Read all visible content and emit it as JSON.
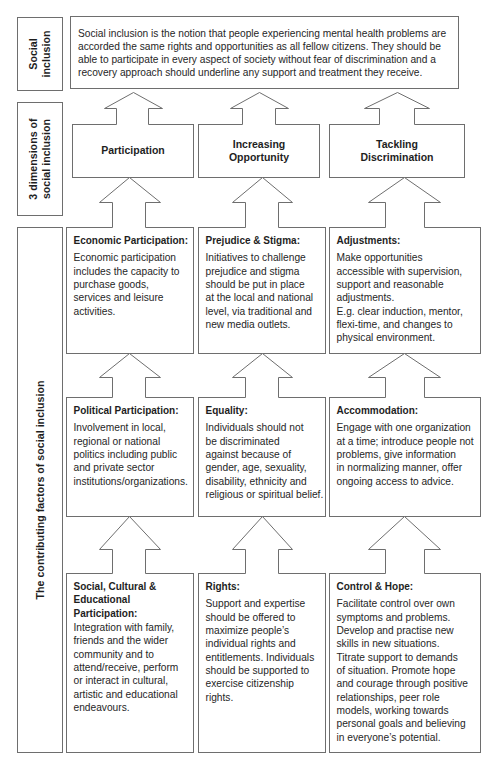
{
  "labels": {
    "social_inclusion": "Social\ninclusion",
    "dimensions": "3 dimensions of\nsocial inclusion",
    "factors": "The contributing factors of social inclusion"
  },
  "definition": "Social inclusion is the notion that people experiencing mental health problems are\naccorded the same rights and opportunities as all fellow citizens. They should be\nable to participate in every aspect of society without fear of discrimination and a\nrecovery approach should underline any support and treatment they receive.",
  "dimensions": [
    {
      "label": "Participation"
    },
    {
      "label": "Increasing\nOpportunity"
    },
    {
      "label": "Tackling\nDiscrimination"
    }
  ],
  "factors": {
    "rows": [
      {
        "cards": [
          {
            "heading": "Economic Participation:",
            "body": "Economic participation\nincludes the capacity to\npurchase goods,\nservices and leisure\nactivities."
          },
          {
            "heading": "Prejudice & Stigma:",
            "body": "Initiatives to challenge\nprejudice and stigma\nshould be put in place\nat the local and national\nlevel, via traditional and\nnew media outlets."
          },
          {
            "heading": "Adjustments:",
            "body": "Make opportunities\naccessible with supervision,\nsupport and reasonable\nadjustments.\nE.g. clear induction, mentor,\nflexi-time, and changes to\nphysical environment."
          }
        ]
      },
      {
        "cards": [
          {
            "heading": "Political Participation:",
            "body": "Involvement in local,\nregional or national\npolitics including public\nand private sector\ninstitutions/organizations."
          },
          {
            "heading": "Equality:",
            "body": "Individuals should not\nbe discriminated\nagainst because of\ngender, age, sexuality,\ndisability, ethnicity and\nreligious or spiritual belief."
          },
          {
            "heading": "Accommodation:",
            "body": "Engage with one organization\nat a time; introduce people not\nproblems, give information\nin normalizing manner, offer\nongoing access to advice."
          }
        ]
      },
      {
        "cards": [
          {
            "heading": "Social, Cultural &\nEducational\nParticipation:",
            "body": "Integration with family,\nfriends and the wider\ncommunity and to\nattend/receive, perform\nor interact in cultural,\nartistic and educational\nendeavours."
          },
          {
            "heading": "Rights:",
            "body": "Support and expertise\nshould be offered to\nmaximize people’s\nindividual rights and\nentitlements. Individuals\nshould be supported to\nexercise citizenship\nrights."
          },
          {
            "heading": "Control & Hope:",
            "body": "Facilitate control over own\nsymptoms and problems.\nDevelop and practise new\nskills in new situations.\nTitrate support to demands\nof situation. Promote hope\nand courage through positive\nrelationships, peer role\nmodels, working towards\npersonal goals and believing\nin everyone’s potential."
          }
        ]
      }
    ]
  }
}
